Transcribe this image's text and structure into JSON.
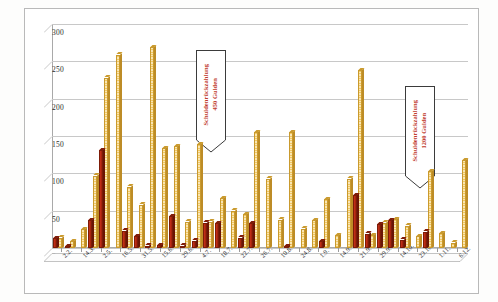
{
  "chart_data": {
    "type": "bar",
    "title": "",
    "xlabel": "",
    "ylabel": "",
    "ylim": [
      0,
      300
    ],
    "yticks": [
      0,
      50,
      100,
      150,
      200,
      250,
      300
    ],
    "grid": true,
    "legend_position": "top-right",
    "categories": [
      "2.2.",
      "14.3.",
      "2.5.",
      "16.5.",
      "31.5.",
      "15.6.",
      "29.6.",
      "4.7.",
      "18.7.",
      "22.7.",
      "26.7.",
      "10.8.",
      "24.8.",
      "1.9.",
      "14.9.",
      "21.9.",
      "29.9.",
      "14.10.",
      "23.10.",
      "1.11.",
      "6.12."
    ],
    "series": [
      {
        "name": "Gulden",
        "color": "#b12a10",
        "values": [
          13,
          2,
          0,
          37,
          131,
          23,
          16,
          3,
          43,
          3,
          10,
          0,
          34,
          33,
          0,
          0,
          0,
          0,
          7,
          0,
          0
        ]
      },
      {
        "name": "Schock Groschen",
        "color": "#f6d68a",
        "values": [
          14,
          9,
          25,
          97,
          228,
          259,
          82,
          58,
          134,
          136,
          35,
          139,
          67,
          93,
          155,
          93,
          37,
          65,
          238,
          39,
          118
        ]
      }
    ],
    "bars": [
      {
        "x": "2.2.",
        "gulden": 13,
        "schock": 14
      },
      {
        "x": "14.3.",
        "gulden": 2,
        "schock": 9
      },
      {
        "x": "2.5.",
        "gulden": 0,
        "schock": 25
      },
      {
        "x": "16.5.",
        "gulden": 37,
        "schock": 97
      },
      {
        "x": "16.5.b",
        "gulden": 131,
        "schock": 228
      },
      {
        "x": "31.5.",
        "gulden": 0,
        "schock": 259
      },
      {
        "x": "31.5.b",
        "gulden": 23,
        "schock": 82
      },
      {
        "x": "15.6.",
        "gulden": 16,
        "schock": 58
      },
      {
        "x": "15.6.b",
        "gulden": 3,
        "schock": 269
      },
      {
        "x": "29.6.",
        "gulden": 4,
        "schock": 134
      },
      {
        "x": "29.6.b",
        "gulden": 43,
        "schock": 136
      },
      {
        "x": "4.7.",
        "gulden": 3,
        "schock": 35
      },
      {
        "x": "4.7.b",
        "gulden": 10,
        "schock": 139
      },
      {
        "x": "18.7.",
        "gulden": 34,
        "schock": 35
      },
      {
        "x": "18.7.b",
        "gulden": 33,
        "schock": 67
      },
      {
        "x": "22.7.",
        "gulden": 0,
        "schock": 50
      },
      {
        "x": "26.7.",
        "gulden": 14,
        "schock": 45
      },
      {
        "x": "26.7.b",
        "gulden": 33,
        "schock": 155
      },
      {
        "x": "10.8.",
        "gulden": 0,
        "schock": 93
      },
      {
        "x": "24.8.",
        "gulden": 0,
        "schock": 38
      },
      {
        "x": "24.8.b",
        "gulden": 1,
        "schock": 155
      },
      {
        "x": "1.9.",
        "gulden": 0,
        "schock": 26
      },
      {
        "x": "1.9.b",
        "gulden": 0,
        "schock": 37
      },
      {
        "x": "14.9.",
        "gulden": 9,
        "schock": 65
      },
      {
        "x": "21.9.",
        "gulden": 0,
        "schock": 17
      },
      {
        "x": "21.9.b",
        "gulden": 0,
        "schock": 93
      },
      {
        "x": "29.9.",
        "gulden": 71,
        "schock": 238
      },
      {
        "x": "29.9.b",
        "gulden": 19,
        "schock": 17
      },
      {
        "x": "14.10.",
        "gulden": 32,
        "schock": 34
      },
      {
        "x": "14.10.b",
        "gulden": 37,
        "schock": 39
      },
      {
        "x": "23.10.",
        "gulden": 11,
        "schock": 30
      },
      {
        "x": "23.10.b",
        "gulden": 0,
        "schock": 16
      },
      {
        "x": "1.11.",
        "gulden": 22,
        "schock": 103
      },
      {
        "x": "1.11.b",
        "gulden": 0,
        "schock": 20
      },
      {
        "x": "6.12.",
        "gulden": 0,
        "schock": 7
      },
      {
        "x": "6.12.b",
        "gulden": 0,
        "schock": 118
      }
    ],
    "annotations": [
      {
        "id": "callout-450",
        "line1": "Schuldenrückzahlung",
        "line2": "450 Gulden",
        "color": "#c0392b"
      },
      {
        "id": "callout-1200",
        "line1": "Schuldenrückzahlung",
        "line2": "1200 Gulden",
        "color": "#c0392b"
      }
    ]
  },
  "legend": {
    "gulden_label": "Gulden",
    "schock_label": "Schock Groschen"
  },
  "annotations": {
    "first": "Schuldenrückzahlung 450 Gulden",
    "second": "Schuldenrückzahlung 1200 Gulden"
  }
}
